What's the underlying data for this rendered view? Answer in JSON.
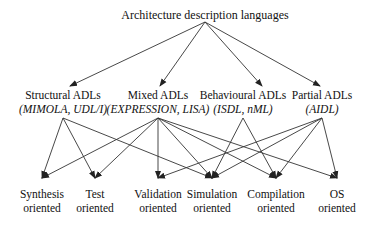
{
  "diagram": {
    "root": {
      "id": "root",
      "label": "Architecture description languages",
      "x": 205,
      "y": 8,
      "anchor": [
        205,
        22
      ]
    },
    "categories": [
      {
        "id": "structural",
        "label": "Structural ADLs",
        "examples": "(MIMOLA, UDL/I)",
        "x": 63,
        "y": 88,
        "top": [
          70,
          86
        ],
        "bottom": [
          63,
          118
        ]
      },
      {
        "id": "mixed",
        "label": "Mixed ADLs",
        "examples": "(EXPRESSION, LISA)",
        "x": 158,
        "y": 88,
        "top": [
          160,
          86
        ],
        "bottom": [
          158,
          118
        ]
      },
      {
        "id": "behavioural",
        "label": "Behavioural ADLs",
        "examples": "(ISDL, nML)",
        "x": 243,
        "y": 88,
        "top": [
          262,
          86
        ],
        "bottom": [
          243,
          118
        ]
      },
      {
        "id": "partial",
        "label": "Partial ADLs",
        "examples": "(AIDL)",
        "x": 322,
        "y": 88,
        "top": [
          320,
          86
        ],
        "bottom": [
          322,
          118
        ]
      }
    ],
    "targets": [
      {
        "id": "synthesis",
        "line1": "Synthesis",
        "line2": "oriented",
        "x": 42,
        "y": 187,
        "tip": [
          42,
          178
        ]
      },
      {
        "id": "test",
        "line1": "Test",
        "line2": "oriented",
        "x": 95,
        "y": 187,
        "tip": [
          95,
          178
        ]
      },
      {
        "id": "validation",
        "line1": "Validation",
        "line2": "oriented",
        "x": 158,
        "y": 187,
        "tip": [
          158,
          178
        ]
      },
      {
        "id": "simulation",
        "line1": "Simulation",
        "line2": "oriented",
        "x": 212,
        "y": 187,
        "tip": [
          212,
          178
        ]
      },
      {
        "id": "compilation",
        "line1": "Compilation",
        "line2": "oriented",
        "x": 276,
        "y": 187,
        "tip": [
          276,
          178
        ]
      },
      {
        "id": "os",
        "line1": "OS",
        "line2": "oriented",
        "x": 337,
        "y": 187,
        "tip": [
          337,
          178
        ]
      }
    ],
    "edges": [
      [
        "root",
        "structural"
      ],
      [
        "root",
        "mixed"
      ],
      [
        "root",
        "behavioural"
      ],
      [
        "root",
        "partial"
      ],
      [
        "structural",
        "synthesis"
      ],
      [
        "structural",
        "test"
      ],
      [
        "structural",
        "simulation"
      ],
      [
        "mixed",
        "synthesis"
      ],
      [
        "mixed",
        "test"
      ],
      [
        "mixed",
        "validation"
      ],
      [
        "mixed",
        "simulation"
      ],
      [
        "mixed",
        "compilation"
      ],
      [
        "mixed",
        "os"
      ],
      [
        "behavioural",
        "simulation"
      ],
      [
        "behavioural",
        "compilation"
      ],
      [
        "partial",
        "validation"
      ],
      [
        "partial",
        "simulation"
      ],
      [
        "partial",
        "compilation"
      ],
      [
        "partial",
        "os"
      ]
    ],
    "colors": {
      "line": "#333333",
      "text": "#111111",
      "background": "#ffffff"
    }
  }
}
